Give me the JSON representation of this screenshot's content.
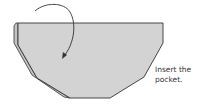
{
  "diagram": {
    "type": "origami-fold-step",
    "caption": {
      "line1": "Insert the",
      "line2": "pocket."
    },
    "colors": {
      "paper_fill": "#d3d3d3",
      "back_layer_fill": "#c4c4c4",
      "outline": "#333333",
      "arrow": "#333333",
      "background": "#ffffff"
    },
    "elements": {
      "arrow": "curved-fold-arrow",
      "shape": "hexagonal-paper-piece",
      "pocket_layer": "inner-pocket-edge"
    }
  }
}
